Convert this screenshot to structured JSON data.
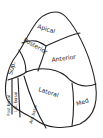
{
  "diagram": {
    "type": "lung-segments-line-drawing",
    "stroke_color": "#222222",
    "background": "#ffffff",
    "segments": [
      {
        "id": "apical",
        "label": "Apical"
      },
      {
        "id": "posterior",
        "label": "Posterior"
      },
      {
        "id": "anterior",
        "label": "Anterior"
      },
      {
        "id": "superior",
        "label": "Sup."
      },
      {
        "id": "lateral",
        "label": "Lateral"
      },
      {
        "id": "medial",
        "label": "Med"
      },
      {
        "id": "posterior-basal",
        "label": "Post basal"
      },
      {
        "id": "lateral-basal",
        "label": "Lat. basal"
      },
      {
        "id": "anterior-basal",
        "label": "Ant basal"
      }
    ]
  }
}
